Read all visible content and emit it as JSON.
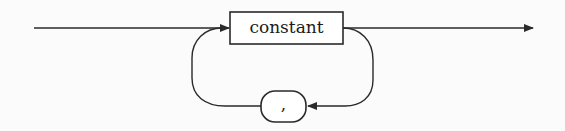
{
  "diagram": {
    "type": "syntax-railroad",
    "nonterminal": {
      "label": "constant"
    },
    "terminal": {
      "label": ","
    },
    "colors": {
      "stroke": "#2a2a2a",
      "background": "#fbfbfb"
    }
  }
}
